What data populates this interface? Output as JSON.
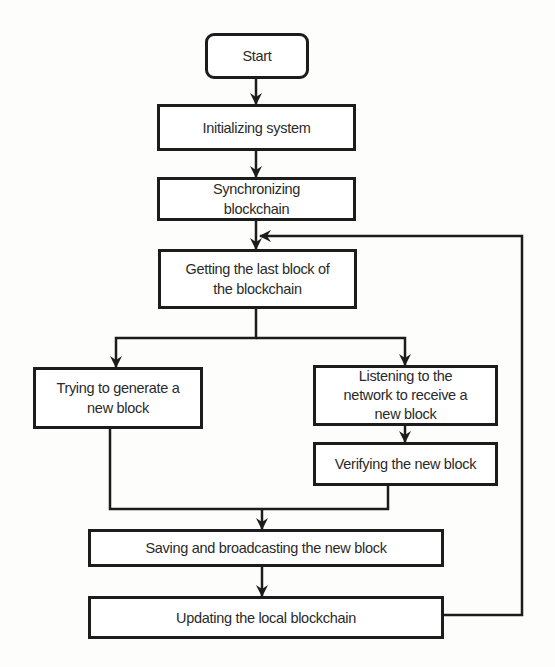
{
  "diagram": {
    "type": "flowchart",
    "colors": {
      "stroke": "#1c1c1c",
      "text": "#2a2a2a",
      "background": "#fdfdfb",
      "box_fill": "#ffffff"
    },
    "nodes": [
      {
        "id": "start",
        "label": "Start",
        "shape": "rounded-rect"
      },
      {
        "id": "init",
        "label": "Initializing system",
        "shape": "rect"
      },
      {
        "id": "sync",
        "label": "Synchronizing blockchain",
        "shape": "rect"
      },
      {
        "id": "get_last",
        "label": "Getting the last block of the blockchain",
        "shape": "rect"
      },
      {
        "id": "generate",
        "label": "Trying to generate a new block",
        "shape": "rect"
      },
      {
        "id": "listen",
        "label": "Listening to the network to receive a new block",
        "shape": "rect"
      },
      {
        "id": "verify",
        "label": "Verifying the new block",
        "shape": "rect"
      },
      {
        "id": "save",
        "label": "Saving and broadcasting the new block",
        "shape": "rect"
      },
      {
        "id": "update",
        "label": "Updating the local blockchain",
        "shape": "rect"
      }
    ],
    "edges": [
      {
        "from": "start",
        "to": "init"
      },
      {
        "from": "init",
        "to": "sync"
      },
      {
        "from": "sync",
        "to": "get_last"
      },
      {
        "from": "get_last",
        "to": "generate"
      },
      {
        "from": "get_last",
        "to": "listen"
      },
      {
        "from": "listen",
        "to": "verify"
      },
      {
        "from": "generate",
        "to": "save"
      },
      {
        "from": "verify",
        "to": "save"
      },
      {
        "from": "save",
        "to": "update"
      },
      {
        "from": "update",
        "to": "get_last",
        "note": "loop back"
      }
    ],
    "labels": {
      "start": [
        "Start"
      ],
      "init": [
        "Initializing system"
      ],
      "sync": [
        "Synchronizing",
        "blockchain"
      ],
      "get_last": [
        "Getting the last block of",
        "the blockchain"
      ],
      "generate": [
        "Trying to generate a",
        "new block"
      ],
      "listen": [
        "Listening to the",
        "network to receive a",
        "new block"
      ],
      "verify": [
        "Verifying the new block"
      ],
      "save": [
        "Saving and broadcasting the new block"
      ],
      "update": [
        "Updating the local blockchain"
      ]
    }
  }
}
